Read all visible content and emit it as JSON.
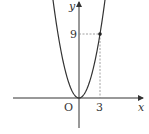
{
  "chart_data": {
    "type": "line",
    "title": "",
    "function": "y = x^2",
    "xlabel": "x",
    "ylabel": "y",
    "origin_label": "O",
    "marked_point": {
      "x": 3,
      "y": 9
    },
    "x_ticks": [
      "3"
    ],
    "y_ticks": [
      "9"
    ],
    "x": [
      -3.7,
      -3,
      -2,
      -1,
      0,
      1,
      2,
      3,
      3.7
    ],
    "y": [
      13.69,
      9,
      4,
      1,
      0,
      1,
      4,
      9,
      13.69
    ],
    "guides": "dashed lines from (3,9) to both axes",
    "grid": false,
    "legend": null
  },
  "labels": {
    "x_axis": "x",
    "y_axis": "y",
    "origin": "O",
    "x_tick": "3",
    "y_tick": "9"
  },
  "colors": {
    "axis": "#333333",
    "curve": "#333333",
    "guide": "#888888"
  }
}
